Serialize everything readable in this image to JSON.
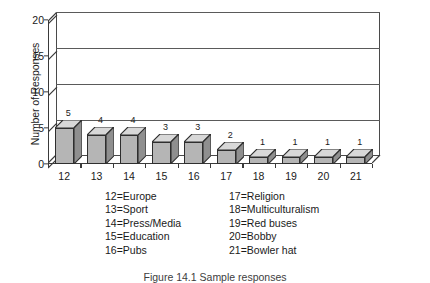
{
  "chart_data": {
    "type": "bar",
    "title": "",
    "xlabel": "",
    "ylabel": "Number of Responses",
    "categories": [
      "12",
      "13",
      "14",
      "15",
      "16",
      "17",
      "18",
      "19",
      "20",
      "21"
    ],
    "values": [
      5,
      4,
      4,
      3,
      3,
      2,
      1,
      1,
      1,
      1
    ],
    "data_labels": [
      "5",
      "4",
      "4",
      "3",
      "3",
      "2",
      "1",
      "1",
      "1",
      "1"
    ],
    "ylim": [
      0,
      20
    ],
    "yticks": [
      0,
      5,
      10,
      15,
      20
    ],
    "ytick_labels": [
      "0",
      "5",
      "10",
      "15",
      "20"
    ],
    "grid": true,
    "grid_axis": "y",
    "legend_position": "below-plot",
    "style": "3d-column",
    "bar_face_color": "#b5b5b5",
    "bar_top_color": "#d8d8d8",
    "bar_side_color": "#8f8f8f",
    "bar_edge_color": "#2e2e2e",
    "axis_color": "#3a3a3a",
    "background_color": "#ffffff"
  },
  "legend": {
    "column_left": [
      "12=Europe",
      "13=Sport",
      "14=Press/Media",
      "15=Education",
      "16=Pubs"
    ],
    "column_right": [
      "17=Religion",
      "18=Multiculturalism",
      "19=Red buses",
      "20=Bobby",
      "21=Bowler hat"
    ]
  },
  "caption": {
    "text": "Figure 14.1  Sample responses"
  }
}
